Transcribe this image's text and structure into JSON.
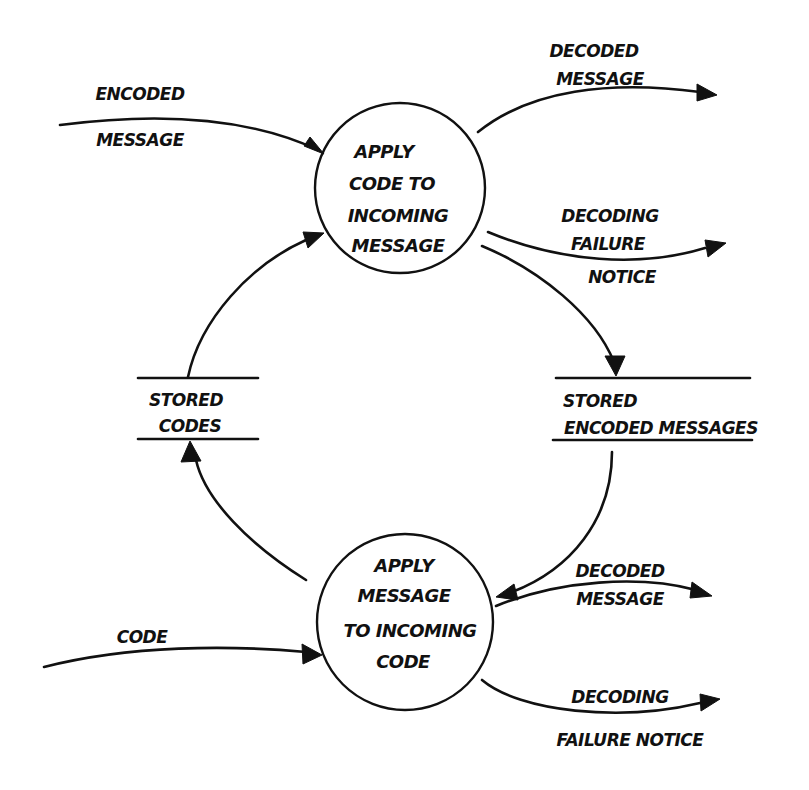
{
  "diagram": {
    "type": "data-flow-diagram",
    "style": "hand-drawn",
    "colors": {
      "ink": "#111111",
      "background": "#ffffff"
    },
    "processes": [
      {
        "id": "p1",
        "lines": [
          "APPLY",
          "CODE TO",
          "INCOMING",
          "MESSAGE"
        ]
      },
      {
        "id": "p2",
        "lines": [
          "APPLY",
          "MESSAGE",
          "TO INCOMING",
          "CODE"
        ]
      }
    ],
    "stores": [
      {
        "id": "s1",
        "lines": [
          "STORED",
          "CODES"
        ]
      },
      {
        "id": "s2",
        "lines": [
          "STORED",
          "ENCODED MESSAGES"
        ]
      }
    ],
    "flows": [
      {
        "id": "f1",
        "from": "external",
        "to": "p1",
        "lines": [
          "ENCODED",
          "MESSAGE"
        ]
      },
      {
        "id": "f2",
        "from": "p1",
        "to": "external",
        "lines": [
          "DECODED",
          "MESSAGE"
        ]
      },
      {
        "id": "f3",
        "from": "p1",
        "to": "external",
        "lines": [
          "DECODING",
          "FAILURE",
          "NOTICE"
        ]
      },
      {
        "id": "f4",
        "from": "p1",
        "to": "s2",
        "lines": []
      },
      {
        "id": "f5",
        "from": "s2",
        "to": "p2",
        "lines": []
      },
      {
        "id": "f6",
        "from": "external",
        "to": "p2",
        "lines": [
          "CODE"
        ]
      },
      {
        "id": "f7",
        "from": "p2",
        "to": "external",
        "lines": [
          "DECODED",
          "MESSAGE"
        ]
      },
      {
        "id": "f8",
        "from": "p2",
        "to": "external",
        "lines": [
          "DECODING",
          "FAILURE NOTICE"
        ]
      },
      {
        "id": "f9",
        "from": "p2",
        "to": "s1",
        "lines": []
      },
      {
        "id": "f10",
        "from": "s1",
        "to": "p1",
        "lines": []
      }
    ]
  }
}
